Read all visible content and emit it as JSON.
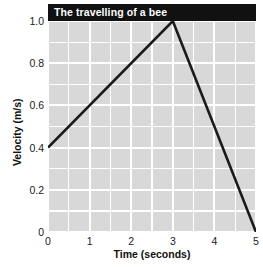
{
  "chart_data": {
    "type": "line",
    "title": "The travelling of a bee",
    "xlabel": "Time (seconds)",
    "ylabel": "Velocity (m/s)",
    "xlim": [
      0,
      5
    ],
    "ylim": [
      0,
      1.0
    ],
    "grid": true,
    "legend": "none",
    "x_ticks": [
      "0",
      "1",
      "2",
      "3",
      "4",
      "5"
    ],
    "x_tick_values": [
      0,
      1,
      2,
      3,
      4,
      5
    ],
    "x_minor_step": 0.5,
    "y_ticks": [
      "0",
      "0.2",
      "0.4",
      "0.6",
      "0.8",
      "1.0"
    ],
    "y_tick_values": [
      0,
      0.2,
      0.4,
      0.6,
      0.8,
      1.0
    ],
    "y_minor_step": 0.1,
    "series": [
      {
        "name": "velocity",
        "color": "#1a1a1a",
        "x": [
          0,
          3,
          5
        ],
        "y": [
          0.4,
          1.0,
          0.0
        ],
        "points": [
          {
            "x": 0,
            "y": 0.4
          },
          {
            "x": 3,
            "y": 1.0
          },
          {
            "x": 5,
            "y": 0.0
          }
        ]
      }
    ]
  },
  "style": {
    "panel_color": "#d8d8d8",
    "grid_color": "#ffffff",
    "title_bar_color": "#111111",
    "title_text_color": "#ffffff",
    "line_color": "#1a1a1a",
    "tick_text_color": "#1a1a1a"
  }
}
